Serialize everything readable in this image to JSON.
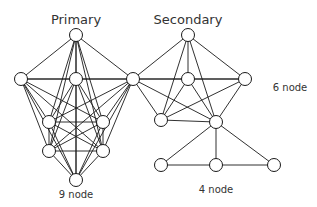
{
  "labels": {
    "primary": "Primary",
    "secondary": "Secondary",
    "nine_node": "9 node",
    "six_node": "6 node",
    "four_node": "4 node"
  },
  "colors": {
    "stroke": "#1a1a1a",
    "node_fill": "#ffffff",
    "text": "#333333"
  },
  "nodes": {
    "p_top": [
      76,
      35
    ],
    "p_left": [
      21,
      79
    ],
    "p_center": [
      76,
      79
    ],
    "shared": [
      133,
      79
    ],
    "p_midl": [
      49,
      122
    ],
    "p_midr": [
      103,
      122
    ],
    "p_lowl": [
      49,
      151
    ],
    "p_lowr": [
      103,
      151
    ],
    "p_bottom": [
      76,
      180
    ],
    "s_top": [
      188,
      35
    ],
    "s_center": [
      188,
      79
    ],
    "s_right": [
      245,
      79
    ],
    "s_lowl": [
      161,
      120
    ],
    "s_lowr": [
      216,
      122
    ],
    "f_left": [
      161,
      165
    ],
    "f_mid": [
      216,
      165
    ],
    "f_right": [
      274,
      165
    ]
  },
  "groups": {
    "primary_complete": [
      "p_top",
      "p_left",
      "p_center",
      "shared",
      "p_midl",
      "p_midr",
      "p_lowl",
      "p_lowr",
      "p_bottom"
    ],
    "secondary_complete": [
      "s_top",
      "shared",
      "s_center",
      "s_right",
      "s_lowl",
      "s_lowr"
    ],
    "four_edges": [
      [
        "s_lowr",
        "f_left"
      ],
      [
        "s_lowr",
        "f_mid"
      ],
      [
        "s_lowr",
        "f_right"
      ],
      [
        "f_left",
        "f_mid"
      ],
      [
        "f_mid",
        "f_right"
      ]
    ]
  }
}
